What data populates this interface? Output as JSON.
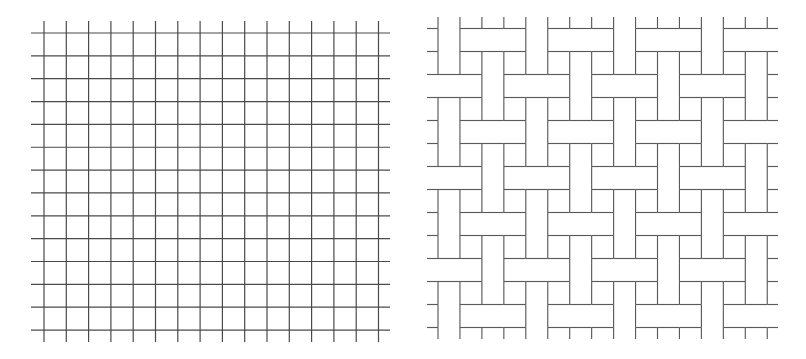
{
  "figure": {
    "width": 806,
    "height": 359,
    "background": "#ffffff",
    "line_colors": {
      "plain_grid": "#4a4a4a",
      "basket_weave": "#5a5a5a"
    }
  },
  "panels": [
    {
      "id": "plain-grid",
      "type": "square-grid",
      "vertical_lines": {
        "count": 16,
        "x_start": 44,
        "spacing": 22.3,
        "y_top": 21,
        "y_bottom": 342
      },
      "horizontal_lines": {
        "count": 14,
        "y_start": 33,
        "spacing": 22.85,
        "x_left": 31,
        "x_right": 390
      }
    },
    {
      "id": "basket-weave",
      "type": "weave",
      "description": "Cells: H = weft (horizontal bar) on top, V = warp (vertical bar) on top. Rows -1..13, columns -1..15.",
      "clip": {
        "x1": 427,
        "y1": 17,
        "x2": 778,
        "y2": 339
      },
      "col_lines": {
        "x0": 438,
        "spacing": 21.95,
        "first_index": -1,
        "last_index": 16
      },
      "row_lines": {
        "y0": 28.5,
        "spacing": 23.0,
        "first_index": -1,
        "last_index": 14
      },
      "first_row_index": -1,
      "first_col_index": -1,
      "cells": [
        "VVVVVVVVVVVVVVVVV",
        "HVHHHVHHHVHHHVHHH",
        "VVVVVVVVVVVVVVVVV",
        "HHHVHHHVHHHVHHHVH",
        "VVVVVVVVVVVVVVVVV",
        "HVHHHVHHHVHHHVHHH",
        "VVVVVVVVVVVVVVVVV",
        "HHHVHHHVHHHVHHHVH",
        "VVVVVVVVVVVVVVVVV",
        "HVHHHVHHHVHHHVHHH",
        "VVVVVVVVVVVVVVVVV",
        "HHHVHHHVHHHVHHHVH",
        "VVVVVVVVVVVVVVVVV",
        "HVHHHVHHHVHHHVHHH",
        "VVVVVVVVVVVVVVVVV"
      ]
    }
  ]
}
